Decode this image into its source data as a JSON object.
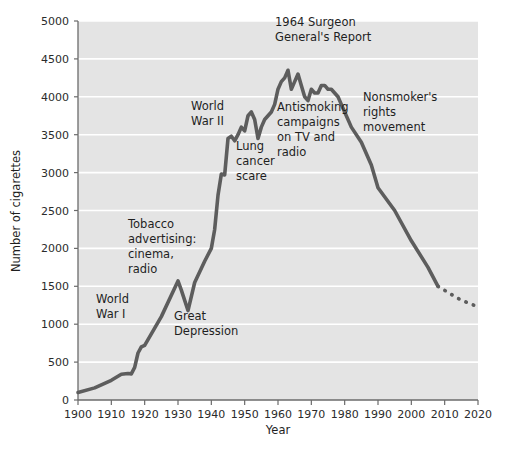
{
  "chart_data": {
    "type": "line",
    "title": "",
    "xlabel": "Year",
    "ylabel": "Number of cigarettes",
    "xlim": [
      1900,
      2020
    ],
    "ylim": [
      0,
      5000
    ],
    "grid": true,
    "legend": "none",
    "xticks": [
      1900,
      1910,
      1920,
      1930,
      1940,
      1950,
      1960,
      1970,
      1980,
      1990,
      2000,
      2010,
      2020
    ],
    "yticks": [
      0,
      500,
      1000,
      1500,
      2000,
      2500,
      3000,
      3500,
      4000,
      4500,
      5000
    ],
    "series": [
      {
        "name": "Per capita cigarette consumption",
        "style": "solid",
        "x": [
          1900,
          1905,
          1910,
          1913,
          1915,
          1916,
          1917,
          1918,
          1919,
          1920,
          1925,
          1930,
          1931,
          1933,
          1935,
          1938,
          1940,
          1941,
          1942,
          1943,
          1944,
          1945,
          1946,
          1947,
          1948,
          1949,
          1950,
          1951,
          1952,
          1953,
          1954,
          1955,
          1956,
          1957,
          1958,
          1959,
          1960,
          1961,
          1962,
          1963,
          1964,
          1965,
          1966,
          1967,
          1968,
          1969,
          1970,
          1971,
          1972,
          1973,
          1974,
          1975,
          1976,
          1977,
          1978,
          1979,
          1980,
          1982,
          1985,
          1988,
          1990,
          1995,
          2000,
          2005,
          2008
        ],
        "y": [
          100,
          160,
          260,
          340,
          350,
          345,
          430,
          620,
          700,
          720,
          1100,
          1570,
          1450,
          1180,
          1550,
          1830,
          2000,
          2250,
          2700,
          2980,
          2970,
          3450,
          3480,
          3420,
          3500,
          3600,
          3550,
          3750,
          3800,
          3700,
          3450,
          3600,
          3700,
          3750,
          3800,
          3900,
          4100,
          4200,
          4250,
          4350,
          4100,
          4200,
          4300,
          4150,
          4000,
          3950,
          4100,
          4050,
          4050,
          4150,
          4150,
          4100,
          4100,
          4050,
          4000,
          3900,
          3800,
          3600,
          3400,
          3100,
          2800,
          2500,
          2100,
          1750,
          1500
        ],
        "color": "#5d5d5d"
      },
      {
        "name": "Projection",
        "style": "dotted",
        "x": [
          2008,
          2011,
          2014,
          2017,
          2020
        ],
        "y": [
          1500,
          1420,
          1340,
          1280,
          1230
        ],
        "color": "#5d5d5d"
      }
    ],
    "annotations": [
      {
        "id": "world-war-i",
        "lines": [
          "World",
          "War I"
        ],
        "x": 96,
        "y": 303,
        "anchor": "start"
      },
      {
        "id": "tobacco-advertising",
        "lines": [
          "Tobacco",
          "advertising:",
          "cinema,",
          "radio"
        ],
        "x": 128,
        "y": 228,
        "anchor": "start"
      },
      {
        "id": "great-depression",
        "lines": [
          "Great",
          "Depression"
        ],
        "x": 174,
        "y": 320,
        "anchor": "start"
      },
      {
        "id": "world-war-ii",
        "lines": [
          "World",
          "War II"
        ],
        "x": 191,
        "y": 110,
        "anchor": "start"
      },
      {
        "id": "lung-cancer-scare",
        "lines": [
          "Lung",
          "cancer",
          "scare"
        ],
        "x": 236,
        "y": 150,
        "anchor": "start"
      },
      {
        "id": "surgeon-general-report",
        "lines": [
          "1964 Surgeon",
          "General's Report"
        ],
        "x": 275,
        "y": 26,
        "anchor": "start"
      },
      {
        "id": "antismoking-campaigns",
        "lines": [
          "Antismoking",
          "campaigns",
          "on TV and",
          "radio"
        ],
        "x": 277,
        "y": 111,
        "anchor": "start"
      },
      {
        "id": "nonsmokers-rights",
        "lines": [
          "Nonsmoker's",
          "rights",
          "movement"
        ],
        "x": 363,
        "y": 101,
        "anchor": "start"
      }
    ],
    "colors": {
      "plot_background": "#e4e4e4",
      "gridline": "#ffffff",
      "line": "#5d5d5d",
      "axis": "#6b6b6b",
      "text": "#1f1f1f",
      "page_background": "#ffffff"
    },
    "plot_box": {
      "left": 78,
      "right": 478,
      "top": 21,
      "bottom": 400
    }
  }
}
